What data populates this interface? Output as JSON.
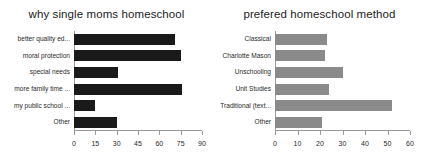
{
  "figure": {
    "background": "#ffffff"
  },
  "charts": [
    {
      "id": "why-single-moms-homeschool",
      "title": "why single moms homeschool",
      "bar_color": "#1a1a1a"
    },
    {
      "id": "prefered-homeschool-method",
      "title": "prefered homeschool method",
      "bar_color": "#8a8a8a"
    }
  ],
  "chart_data": [
    {
      "type": "bar",
      "orientation": "horizontal",
      "title": "why single moms homeschool",
      "xlabel": "",
      "ylabel": "",
      "categories": [
        "better quality ed...",
        "moral protection",
        "special needs",
        "more family time ...",
        "my public school ...",
        "Other"
      ],
      "values": [
        71,
        75,
        31,
        76,
        15,
        30
      ],
      "xlim": [
        0,
        90
      ],
      "xticks": [
        0,
        15,
        30,
        45,
        60,
        75,
        90
      ],
      "xtick_labels": [
        "0",
        "15",
        "30",
        "45",
        "60",
        "75",
        "90"
      ],
      "grid": false,
      "legend": false,
      "color": "#1a1a1a"
    },
    {
      "type": "bar",
      "orientation": "horizontal",
      "title": "prefered homeschool method",
      "xlabel": "",
      "ylabel": "",
      "categories": [
        "Classical",
        "Charlotte Mason",
        "Unschooling",
        "Unit Studies",
        "Traditional (text...",
        "Other"
      ],
      "values": [
        23,
        22,
        30,
        24,
        52,
        21
      ],
      "xlim": [
        0,
        60
      ],
      "xticks": [
        0,
        10,
        20,
        30,
        40,
        50,
        60
      ],
      "xtick_labels": [
        "0",
        "10",
        "20",
        "30",
        "40",
        "50",
        "60"
      ],
      "grid": false,
      "legend": false,
      "color": "#8a8a8a"
    }
  ]
}
